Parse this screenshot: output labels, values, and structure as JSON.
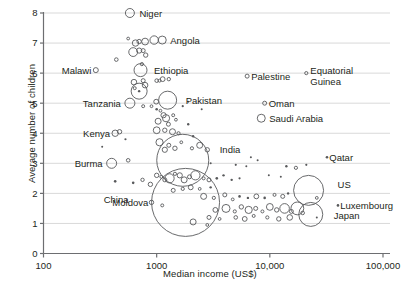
{
  "chart_data": {
    "type": "scatter",
    "title": "",
    "xlabel": "Median income (US$)",
    "ylabel": "Average number of children",
    "xscale": "log",
    "xlim": [
      100,
      100000
    ],
    "ylim": [
      0,
      8
    ],
    "xticks": [
      "100",
      "1000",
      "10,000",
      "100,000"
    ],
    "xtick_values": [
      100,
      1000,
      10000,
      100000
    ],
    "yticks": [
      "0",
      "1",
      "2",
      "3",
      "4",
      "5",
      "6",
      "7",
      "8"
    ],
    "ytick_values": [
      0,
      1,
      2,
      3,
      4,
      5,
      6,
      7,
      8
    ],
    "grid": "horizontal",
    "legend": "none",
    "size_encoding": "population",
    "labeled_points": [
      {
        "name": "Niger",
        "x": 580,
        "y": 8.0,
        "r": 4.5
      },
      {
        "name": "Angola",
        "x": 1120,
        "y": 7.1,
        "r": 4.0
      },
      {
        "name": "Ethiopia",
        "x": 720,
        "y": 6.1,
        "r": 6.5
      },
      {
        "name": "Malawi",
        "x": 290,
        "y": 6.1,
        "r": 2.5
      },
      {
        "name": "Tanzania",
        "x": 580,
        "y": 5.0,
        "r": 5.0
      },
      {
        "name": "Pakistan",
        "x": 1250,
        "y": 5.1,
        "r": 9.0
      },
      {
        "name": "Palestine",
        "x": 6300,
        "y": 5.9,
        "r": 2.0
      },
      {
        "name": "Equatorial Guinea",
        "x": 21000,
        "y": 6.0,
        "r": 1.6
      },
      {
        "name": "Oman",
        "x": 9000,
        "y": 5.0,
        "r": 2.0
      },
      {
        "name": "Saudi Arabia",
        "x": 8400,
        "y": 4.5,
        "r": 4.0
      },
      {
        "name": "Kenya",
        "x": 430,
        "y": 4.0,
        "r": 3.2
      },
      {
        "name": "Burma",
        "x": 400,
        "y": 3.0,
        "r": 5.0
      },
      {
        "name": "India",
        "x": 1700,
        "y": 3.1,
        "r": 26.0
      },
      {
        "name": "Qatar",
        "x": 32000,
        "y": 3.2,
        "r": 1.3
      },
      {
        "name": "China",
        "x": 1800,
        "y": 1.7,
        "r": 34.0
      },
      {
        "name": "Moldova",
        "x": 900,
        "y": 1.7,
        "r": 2.2
      },
      {
        "name": "US",
        "x": 22000,
        "y": 2.1,
        "r": 15.0
      },
      {
        "name": "Luxembourg",
        "x": 40000,
        "y": 1.6,
        "r": 1.3
      },
      {
        "name": "Japan",
        "x": 23000,
        "y": 1.3,
        "r": 12.0
      }
    ],
    "unlabeled_points": [
      {
        "x": 560,
        "y": 7.15,
        "r": 1.4
      },
      {
        "x": 650,
        "y": 7.0,
        "r": 3.2
      },
      {
        "x": 700,
        "y": 7.05,
        "r": 2.2
      },
      {
        "x": 790,
        "y": 7.05,
        "r": 3.4
      },
      {
        "x": 950,
        "y": 7.1,
        "r": 4.2
      },
      {
        "x": 620,
        "y": 6.7,
        "r": 4.4
      },
      {
        "x": 700,
        "y": 6.75,
        "r": 2.6
      },
      {
        "x": 760,
        "y": 6.75,
        "r": 2.0
      },
      {
        "x": 800,
        "y": 6.6,
        "r": 2.2
      },
      {
        "x": 440,
        "y": 6.45,
        "r": 1.8
      },
      {
        "x": 740,
        "y": 6.3,
        "r": 1.6
      },
      {
        "x": 630,
        "y": 5.7,
        "r": 2.8
      },
      {
        "x": 640,
        "y": 5.5,
        "r": 1.5
      },
      {
        "x": 760,
        "y": 5.75,
        "r": 2.0
      },
      {
        "x": 790,
        "y": 5.6,
        "r": 2.8
      },
      {
        "x": 700,
        "y": 5.4,
        "r": 8.0
      },
      {
        "x": 700,
        "y": 5.4,
        "r": 1.2
      },
      {
        "x": 1000,
        "y": 5.75,
        "r": 1.8
      },
      {
        "x": 1060,
        "y": 5.75,
        "r": 1.5
      },
      {
        "x": 1130,
        "y": 5.8,
        "r": 2.4
      },
      {
        "x": 1280,
        "y": 5.8,
        "r": 1.7
      },
      {
        "x": 760,
        "y": 4.9,
        "r": 1.5
      },
      {
        "x": 900,
        "y": 4.9,
        "r": 1.4
      },
      {
        "x": 990,
        "y": 5.05,
        "r": 2.4
      },
      {
        "x": 1000,
        "y": 4.8,
        "r": 1.3
      },
      {
        "x": 1080,
        "y": 4.75,
        "r": 1.4
      },
      {
        "x": 1150,
        "y": 4.6,
        "r": 2.6
      },
      {
        "x": 1210,
        "y": 4.5,
        "r": 3.6
      },
      {
        "x": 1030,
        "y": 4.4,
        "r": 3.0
      },
      {
        "x": 1270,
        "y": 4.3,
        "r": 2.0
      },
      {
        "x": 1400,
        "y": 4.6,
        "r": 1.5
      },
      {
        "x": 1480,
        "y": 4.45,
        "r": 1.4
      },
      {
        "x": 1000,
        "y": 4.1,
        "r": 3.4
      },
      {
        "x": 1180,
        "y": 4.1,
        "r": 2.2
      },
      {
        "x": 1380,
        "y": 4.05,
        "r": 3.0
      },
      {
        "x": 1560,
        "y": 4.0,
        "r": 1.6
      },
      {
        "x": 1900,
        "y": 4.3,
        "r": 1.2
      },
      {
        "x": 2100,
        "y": 3.9,
        "r": 1.2
      },
      {
        "x": 470,
        "y": 4.05,
        "r": 2.2
      },
      {
        "x": 530,
        "y": 3.8,
        "r": 1.1
      },
      {
        "x": 560,
        "y": 3.1,
        "r": 1.8
      },
      {
        "x": 1060,
        "y": 3.7,
        "r": 3.6
      },
      {
        "x": 1180,
        "y": 3.45,
        "r": 2.6
      },
      {
        "x": 1280,
        "y": 3.6,
        "r": 2.0
      },
      {
        "x": 1450,
        "y": 3.5,
        "r": 2.2
      },
      {
        "x": 1650,
        "y": 3.7,
        "r": 1.4
      },
      {
        "x": 2050,
        "y": 3.5,
        "r": 1.6
      },
      {
        "x": 2400,
        "y": 3.6,
        "r": 3.0
      },
      {
        "x": 2800,
        "y": 3.45,
        "r": 2.2
      },
      {
        "x": 750,
        "y": 2.45,
        "r": 1.7
      },
      {
        "x": 1000,
        "y": 2.6,
        "r": 2.2
      },
      {
        "x": 1100,
        "y": 2.55,
        "r": 1.5
      },
      {
        "x": 1180,
        "y": 2.45,
        "r": 2.0
      },
      {
        "x": 1300,
        "y": 2.5,
        "r": 4.6
      },
      {
        "x": 1450,
        "y": 2.65,
        "r": 1.6
      },
      {
        "x": 1600,
        "y": 2.6,
        "r": 2.6
      },
      {
        "x": 1750,
        "y": 2.45,
        "r": 3.0
      },
      {
        "x": 1950,
        "y": 2.55,
        "r": 2.0
      },
      {
        "x": 2200,
        "y": 2.6,
        "r": 4.6
      },
      {
        "x": 2600,
        "y": 2.5,
        "r": 1.5
      },
      {
        "x": 2900,
        "y": 2.45,
        "r": 2.0
      },
      {
        "x": 3400,
        "y": 2.5,
        "r": 1.3
      },
      {
        "x": 3900,
        "y": 2.6,
        "r": 1.2
      },
      {
        "x": 4600,
        "y": 2.45,
        "r": 1.2
      },
      {
        "x": 5400,
        "y": 2.5,
        "r": 1.1
      },
      {
        "x": 430,
        "y": 2.4,
        "r": 1.3
      },
      {
        "x": 620,
        "y": 2.35,
        "r": 1.3
      },
      {
        "x": 880,
        "y": 2.3,
        "r": 2.2
      },
      {
        "x": 1400,
        "y": 2.1,
        "r": 2.0
      },
      {
        "x": 1700,
        "y": 2.15,
        "r": 1.6
      },
      {
        "x": 2000,
        "y": 2.2,
        "r": 2.4
      },
      {
        "x": 2400,
        "y": 2.15,
        "r": 1.4
      },
      {
        "x": 3000,
        "y": 2.2,
        "r": 1.2
      },
      {
        "x": 1120,
        "y": 1.6,
        "r": 1.5
      },
      {
        "x": 2600,
        "y": 1.9,
        "r": 3.0
      },
      {
        "x": 3200,
        "y": 1.85,
        "r": 1.6
      },
      {
        "x": 4000,
        "y": 1.95,
        "r": 2.0
      },
      {
        "x": 4700,
        "y": 1.8,
        "r": 1.4
      },
      {
        "x": 5400,
        "y": 1.9,
        "r": 1.3
      },
      {
        "x": 6400,
        "y": 1.85,
        "r": 1.2
      },
      {
        "x": 7600,
        "y": 1.9,
        "r": 2.4
      },
      {
        "x": 9000,
        "y": 1.85,
        "r": 1.3
      },
      {
        "x": 11000,
        "y": 1.95,
        "r": 1.5
      },
      {
        "x": 13000,
        "y": 1.9,
        "r": 2.0
      },
      {
        "x": 14500,
        "y": 2.0,
        "r": 1.2
      },
      {
        "x": 26000,
        "y": 1.85,
        "r": 1.4
      },
      {
        "x": 3300,
        "y": 1.45,
        "r": 2.4
      },
      {
        "x": 4100,
        "y": 1.5,
        "r": 4.0
      },
      {
        "x": 4900,
        "y": 1.4,
        "r": 1.6
      },
      {
        "x": 5600,
        "y": 1.55,
        "r": 2.2
      },
      {
        "x": 6500,
        "y": 1.45,
        "r": 3.6
      },
      {
        "x": 7500,
        "y": 1.5,
        "r": 2.0
      },
      {
        "x": 8600,
        "y": 1.4,
        "r": 1.5
      },
      {
        "x": 10000,
        "y": 1.55,
        "r": 3.4
      },
      {
        "x": 11500,
        "y": 1.45,
        "r": 2.2
      },
      {
        "x": 13500,
        "y": 1.5,
        "r": 4.8
      },
      {
        "x": 15500,
        "y": 1.4,
        "r": 2.0
      },
      {
        "x": 17500,
        "y": 1.5,
        "r": 6.4
      },
      {
        "x": 19500,
        "y": 1.35,
        "r": 1.8
      },
      {
        "x": 2900,
        "y": 1.2,
        "r": 2.0
      },
      {
        "x": 3600,
        "y": 1.15,
        "r": 1.4
      },
      {
        "x": 5000,
        "y": 1.2,
        "r": 1.8
      },
      {
        "x": 6000,
        "y": 1.15,
        "r": 2.4
      },
      {
        "x": 7200,
        "y": 1.25,
        "r": 1.5
      },
      {
        "x": 9500,
        "y": 1.2,
        "r": 1.6
      },
      {
        "x": 12000,
        "y": 1.15,
        "r": 2.2
      },
      {
        "x": 15000,
        "y": 1.2,
        "r": 2.8
      },
      {
        "x": 2100,
        "y": 1.05,
        "r": 3.0
      },
      {
        "x": 1700,
        "y": 4.9,
        "r": 1.1
      },
      {
        "x": 2500,
        "y": 4.8,
        "r": 1.0
      },
      {
        "x": 1900,
        "y": 5.05,
        "r": 1.0
      },
      {
        "x": 6800,
        "y": 3.2,
        "r": 1.0
      },
      {
        "x": 7800,
        "y": 3.1,
        "r": 1.0
      },
      {
        "x": 3000,
        "y": 3.0,
        "r": 1.0
      },
      {
        "x": 5000,
        "y": 2.95,
        "r": 1.1
      },
      {
        "x": 6200,
        "y": 2.9,
        "r": 1.0
      },
      {
        "x": 14000,
        "y": 2.9,
        "r": 1.2
      },
      {
        "x": 17000,
        "y": 2.85,
        "r": 1.6
      },
      {
        "x": 21000,
        "y": 2.95,
        "r": 1.1
      },
      {
        "x": 9800,
        "y": 2.6,
        "r": 1.0
      },
      {
        "x": 12500,
        "y": 2.55,
        "r": 1.0
      },
      {
        "x": 330,
        "y": 3.55,
        "r": 1.0
      },
      {
        "x": 2800,
        "y": 0.95,
        "r": 1.4
      },
      {
        "x": 26000,
        "y": 1.2,
        "r": 1.0
      }
    ]
  }
}
